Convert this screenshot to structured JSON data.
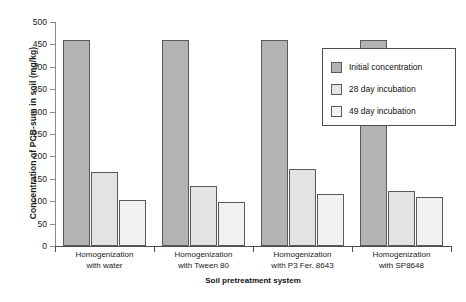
{
  "chart_data": {
    "type": "bar",
    "title": "",
    "xlabel": "Soil pretreatment system",
    "ylabel": "Concentration of PCB-sum in soil (mg/kg)",
    "categories": [
      "Homogenization with water",
      "Homogenization with Tween 80",
      "Homogenization with P3 Fer. 8643",
      "Homogenization with SP8648"
    ],
    "category_lines": [
      [
        "Homogenization",
        "with water"
      ],
      [
        "Homogenization",
        "with Tween 80"
      ],
      [
        "Homogenization",
        "with P3 Fer. 8643"
      ],
      [
        "Homogenization",
        "with SP8648"
      ]
    ],
    "series": [
      {
        "name": "Initial concentration",
        "color": "#b3b3b3",
        "values": [
          460,
          460,
          460,
          460
        ]
      },
      {
        "name": "28 day incubation",
        "color": "#e3e3e3",
        "values": [
          165,
          135,
          172,
          122
        ]
      },
      {
        "name": "49 day incubation",
        "color": "#f1f1f1",
        "values": [
          103,
          98,
          115,
          110
        ]
      }
    ],
    "ylim": [
      0,
      500
    ],
    "yticks": [
      0,
      50,
      100,
      150,
      200,
      250,
      300,
      350,
      400,
      450,
      500
    ],
    "ytick_labels": [
      "0",
      "50",
      "100",
      "150",
      "200",
      "250",
      "300",
      "350",
      "400",
      "450",
      "500"
    ],
    "grid": false,
    "legend_position": "inside-top-right"
  },
  "legend": {
    "items": [
      {
        "label": "Initial concentration",
        "swatch": "#b3b3b3"
      },
      {
        "label": "28 day incubation",
        "swatch": "#e3e3e3"
      },
      {
        "label": "49 day incubation",
        "swatch": "#f1f1f1"
      }
    ]
  }
}
